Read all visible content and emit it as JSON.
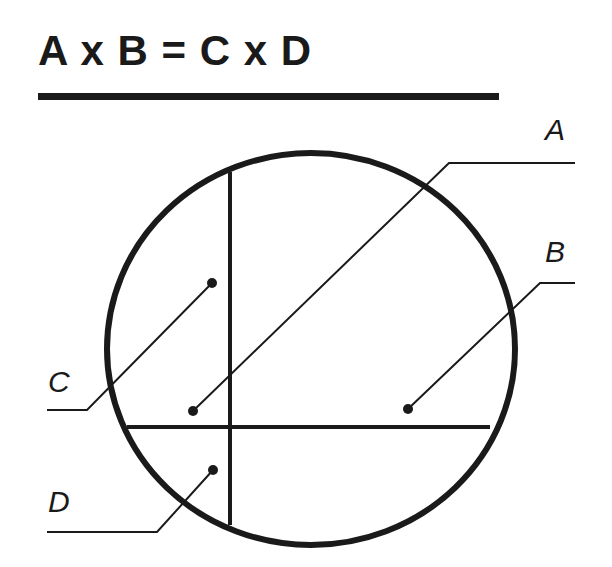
{
  "title": "A x B = C x D",
  "colors": {
    "ink": "#1a1a1a",
    "background": "#ffffff"
  },
  "labels": {
    "a": "A",
    "b": "B",
    "c": "C",
    "d": "D"
  }
}
